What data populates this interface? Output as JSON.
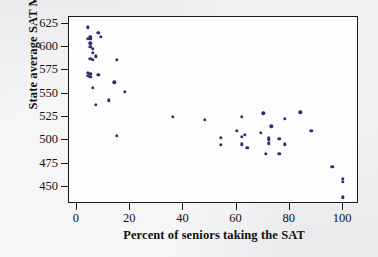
{
  "chart_data": {
    "type": "scatter",
    "title": "",
    "xlabel": "Percent of seniors taking the SAT",
    "ylabel": "State average SAT Math score",
    "xlim": [
      -3,
      106
    ],
    "ylim": [
      432,
      632
    ],
    "xticks": [
      0,
      20,
      40,
      60,
      80,
      100
    ],
    "yticks": [
      450,
      475,
      500,
      525,
      550,
      575,
      600,
      625
    ],
    "grid": false,
    "legend": null,
    "marker_color": "#2c2c78",
    "points": [
      {
        "x": 4,
        "y": 621
      },
      {
        "x": 8,
        "y": 615
      },
      {
        "x": 5,
        "y": 611
      },
      {
        "x": 5,
        "y": 609
      },
      {
        "x": 4,
        "y": 609
      },
      {
        "x": 9,
        "y": 611
      },
      {
        "x": 5,
        "y": 604
      },
      {
        "x": 5,
        "y": 600
      },
      {
        "x": 6,
        "y": 598
      },
      {
        "x": 6,
        "y": 594
      },
      {
        "x": 7,
        "y": 590
      },
      {
        "x": 5,
        "y": 587
      },
      {
        "x": 6,
        "y": 586
      },
      {
        "x": 15,
        "y": 586
      },
      {
        "x": 4,
        "y": 572
      },
      {
        "x": 5,
        "y": 571
      },
      {
        "x": 4,
        "y": 569
      },
      {
        "x": 5,
        "y": 568
      },
      {
        "x": 8,
        "y": 570
      },
      {
        "x": 14,
        "y": 562
      },
      {
        "x": 6,
        "y": 556
      },
      {
        "x": 18,
        "y": 552
      },
      {
        "x": 12,
        "y": 543
      },
      {
        "x": 7,
        "y": 538
      },
      {
        "x": 15,
        "y": 505
      },
      {
        "x": 36,
        "y": 525
      },
      {
        "x": 48,
        "y": 522
      },
      {
        "x": 54,
        "y": 503
      },
      {
        "x": 54,
        "y": 495
      },
      {
        "x": 60,
        "y": 510
      },
      {
        "x": 62,
        "y": 525
      },
      {
        "x": 62,
        "y": 504
      },
      {
        "x": 63,
        "y": 506
      },
      {
        "x": 62,
        "y": 496
      },
      {
        "x": 64,
        "y": 492
      },
      {
        "x": 70,
        "y": 529
      },
      {
        "x": 69,
        "y": 508
      },
      {
        "x": 72,
        "y": 503
      },
      {
        "x": 72,
        "y": 501
      },
      {
        "x": 73,
        "y": 515
      },
      {
        "x": 72,
        "y": 497
      },
      {
        "x": 71,
        "y": 486
      },
      {
        "x": 76,
        "y": 502
      },
      {
        "x": 78,
        "y": 523
      },
      {
        "x": 78,
        "y": 496
      },
      {
        "x": 76,
        "y": 486
      },
      {
        "x": 84,
        "y": 530
      },
      {
        "x": 88,
        "y": 510
      },
      {
        "x": 96,
        "y": 472
      },
      {
        "x": 100,
        "y": 459
      },
      {
        "x": 100,
        "y": 456
      },
      {
        "x": 100,
        "y": 439
      }
    ]
  },
  "ghost_text": {
    "exercises": "EXERCISES"
  }
}
